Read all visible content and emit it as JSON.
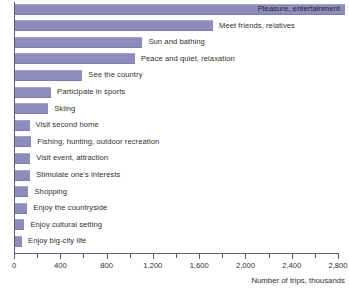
{
  "chart_data": {
    "type": "bar",
    "orientation": "horizontal",
    "title": "",
    "xlabel": "Number of trips, thousands",
    "ylabel": "",
    "xlim": [
      0,
      2800
    ],
    "grid": false,
    "legend": null,
    "bar_color": "#8d8cba",
    "xticks": [
      0,
      400,
      800,
      1200,
      1600,
      2000,
      2400,
      2800
    ],
    "xtick_labels": [
      "0",
      "400",
      "800",
      "1,200",
      "1,600",
      "2,000",
      "2,400",
      "2,800"
    ],
    "minor_tick_step": 200,
    "categories": [
      "Pleasure, entertainment",
      "Meet friends, relatives",
      "Sun and bathing",
      "Peace and quiet, relaxation",
      "See the country",
      "Participate in sports",
      "Skiing",
      "Visit second home",
      "Fishing, hunting, outdoor recreation",
      "Visit event, attraction",
      "Stimulate one's interests",
      "Shopping",
      "Enjoy the countryside",
      "Enjoy cultural setting",
      "Enjoy big-city life"
    ],
    "values": [
      2860,
      1720,
      1110,
      1045,
      590,
      320,
      295,
      135,
      150,
      140,
      140,
      125,
      115,
      90,
      70
    ],
    "label_placement": [
      "inside",
      "outside",
      "outside",
      "outside",
      "outside",
      "outside",
      "outside",
      "outside",
      "outside",
      "outside",
      "outside",
      "outside",
      "outside",
      "outside",
      "outside"
    ]
  },
  "axis": {
    "title": "Number of trips, thousands"
  }
}
